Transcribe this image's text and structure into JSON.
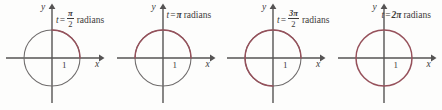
{
  "figure": {
    "name": "unit-circle-radian-progression",
    "background_color": "#fdfdfc",
    "axis_color": "#555353",
    "circle_gray_color": "#6f6c6c",
    "arc_highlight_color": "#96515b",
    "text_color": "#3c3a3a",
    "panel_count": 4
  },
  "panels": [
    {
      "id": "panel-pi-over-2",
      "tick_label": "1",
      "x_axis_label": "x",
      "y_axis_label": "y",
      "equation": {
        "variable": "t",
        "operator": "=",
        "value_numerator": "3",
        "value_is_fraction": true,
        "numerator": "π",
        "denominator": "2",
        "inline_value": "",
        "units": "radians"
      },
      "arc": {
        "start_degrees": 0,
        "end_degrees": 90,
        "sweep_degrees": 90,
        "radians": 1.5707963
      }
    },
    {
      "id": "panel-pi",
      "tick_label": "1",
      "x_axis_label": "x",
      "y_axis_label": "y",
      "equation": {
        "variable": "t",
        "operator": "=",
        "value_is_fraction": false,
        "inline_value": "π",
        "units": "radians"
      },
      "arc": {
        "start_degrees": 0,
        "end_degrees": 180,
        "sweep_degrees": 180,
        "radians": 3.1415927
      }
    },
    {
      "id": "panel-3pi-over-2",
      "tick_label": "1",
      "x_axis_label": "x",
      "y_axis_label": "y",
      "equation": {
        "variable": "t",
        "operator": "=",
        "value_is_fraction": true,
        "numerator": "3π",
        "denominator": "2",
        "inline_value": "",
        "units": "radians"
      },
      "arc": {
        "start_degrees": 0,
        "end_degrees": 270,
        "sweep_degrees": 270,
        "radians": 4.712389
      }
    },
    {
      "id": "panel-2pi",
      "tick_label": "1",
      "x_axis_label": "x",
      "y_axis_label": "y",
      "equation": {
        "variable": "t",
        "operator": "=",
        "value_is_fraction": false,
        "inline_value": "2π",
        "units": "radians"
      },
      "arc": {
        "start_degrees": 0,
        "end_degrees": 360,
        "sweep_degrees": 360,
        "radians": 6.2831853
      }
    }
  ]
}
